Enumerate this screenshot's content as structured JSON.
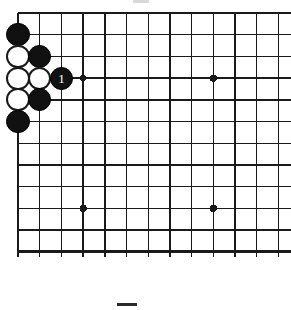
{
  "diagram": {
    "kind": "go-board-diagram",
    "title": "",
    "board": {
      "columns_visible": 13,
      "rows_visible": 12,
      "cell_size": 21.7,
      "origin_x": 18,
      "origin_y": 13,
      "line_color": "#1a1a1a",
      "thin_line_width": 1.4,
      "edge_line_width": 2.6,
      "background_color": "#ffffff",
      "cropped_edges": [
        "right"
      ],
      "edges_drawn": [
        "top",
        "left",
        "bottom"
      ]
    },
    "star_points": [
      {
        "col": 4,
        "row": 4,
        "radius": 3.2
      },
      {
        "col": 10,
        "row": 4,
        "radius": 3.6
      },
      {
        "col": 4,
        "row": 10,
        "radius": 3.6
      },
      {
        "col": 10,
        "row": 10,
        "radius": 3.6
      }
    ],
    "stones": [
      {
        "id": "b-c1r2",
        "color": "black",
        "col": 1,
        "row": 2,
        "label": ""
      },
      {
        "id": "w-c1r3",
        "color": "white",
        "col": 1,
        "row": 3,
        "label": ""
      },
      {
        "id": "w-c1r4",
        "color": "white",
        "col": 1,
        "row": 4,
        "label": ""
      },
      {
        "id": "w-c1r5",
        "color": "white",
        "col": 1,
        "row": 5,
        "label": ""
      },
      {
        "id": "b-c1r6",
        "color": "black",
        "col": 1,
        "row": 6,
        "label": ""
      },
      {
        "id": "b-c2r3",
        "color": "black",
        "col": 2,
        "row": 3,
        "label": ""
      },
      {
        "id": "w-c2r4",
        "color": "white",
        "col": 2,
        "row": 4,
        "label": ""
      },
      {
        "id": "b-c2r5",
        "color": "black",
        "col": 2,
        "row": 5,
        "label": ""
      },
      {
        "id": "b-c3r4",
        "color": "black",
        "col": 3,
        "row": 4,
        "label": "1"
      }
    ],
    "marks": {
      "bottom_dash": {
        "x": 117,
        "y": 303,
        "width": 20,
        "height": 3,
        "color": "#2a2a2a"
      },
      "top_smudge": {
        "x": 133,
        "y": 0,
        "width": 16,
        "height": 3,
        "color": "#d8d8d8"
      }
    },
    "caption": ""
  }
}
